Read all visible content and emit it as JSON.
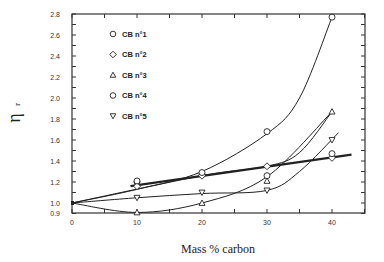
{
  "chart_data": {
    "type": "scatter",
    "title": "",
    "xlabel": "Mass  % carbon",
    "ylabel": "η r",
    "xlim": [
      0,
      45
    ],
    "ylim": [
      0.9,
      2.8
    ],
    "x_ticks": [
      0,
      10,
      20,
      30,
      40
    ],
    "y_ticks": [
      0.9,
      1.0,
      1.2,
      1.4,
      1.6,
      1.8,
      2.0,
      2.2,
      2.4,
      2.6,
      2.8
    ],
    "grid": false,
    "legend_position": "upper-left",
    "series": [
      {
        "name": "CB n°1",
        "marker": "circle",
        "x": [
          10,
          20,
          30,
          40
        ],
        "y": [
          1.2,
          1.27,
          1.68,
          2.77
        ]
      },
      {
        "name": "CB n°2",
        "marker": "diamond",
        "x": [
          10,
          20,
          30,
          40
        ],
        "y": [
          1.16,
          1.26,
          1.35,
          1.43
        ]
      },
      {
        "name": "CB n°3",
        "marker": "triangle-up",
        "x": [
          10,
          20,
          30,
          40
        ],
        "y": [
          0.91,
          1.0,
          1.21,
          1.87
        ]
      },
      {
        "name": "CB n°4",
        "marker": "circle",
        "x": [
          10,
          20,
          30,
          40
        ],
        "y": [
          1.21,
          1.29,
          1.26,
          1.47
        ]
      },
      {
        "name": "CB n°5",
        "marker": "triangle-down",
        "x": [
          10,
          20,
          30,
          40
        ],
        "y": [
          1.05,
          1.1,
          1.12,
          1.6
        ]
      }
    ],
    "fit_curves": [
      {
        "name": "CB n°1 fit",
        "x": [
          0,
          10,
          20,
          30,
          35,
          40
        ],
        "y": [
          1.0,
          1.13,
          1.3,
          1.66,
          2.0,
          2.77
        ]
      },
      {
        "name": "CB n°2 linear fit (thick)",
        "x": [
          9,
          43
        ],
        "y": [
          1.16,
          1.46
        ]
      },
      {
        "name": "CB n°3 fit",
        "x": [
          0,
          10,
          20,
          30,
          40
        ],
        "y": [
          1.0,
          0.91,
          1.0,
          1.25,
          1.87
        ]
      },
      {
        "name": "CB n°4 fit",
        "x": [
          0,
          20,
          30,
          35,
          40
        ],
        "y": [
          1.0,
          1.26,
          1.35,
          1.48,
          1.87
        ]
      },
      {
        "name": "CB n°5 fit",
        "x": [
          0,
          10,
          20,
          30,
          35,
          41
        ],
        "y": [
          1.0,
          1.05,
          1.09,
          1.12,
          1.3,
          1.67
        ]
      }
    ]
  },
  "legend": {
    "items": [
      {
        "label": "CB n°1",
        "symbol": "○"
      },
      {
        "label": "CB n°2",
        "symbol": "◇"
      },
      {
        "label": "CB n°3",
        "symbol": "△"
      },
      {
        "label": "CB n°4",
        "symbol": "○"
      },
      {
        "label": "CB n°5",
        "symbol": "▽"
      }
    ]
  },
  "axes": {
    "x_title": "Mass  % carbon",
    "y_title_main": "η",
    "y_title_sub": "r",
    "x_tick_labels": [
      "0",
      "10",
      "20",
      "30",
      "40"
    ],
    "y_tick_labels": [
      "0.9",
      "1.0",
      "1.2",
      "1.4",
      "1.6",
      "1.8",
      "2.0",
      "2.2",
      "2.4",
      "2.6",
      "2.8"
    ]
  }
}
